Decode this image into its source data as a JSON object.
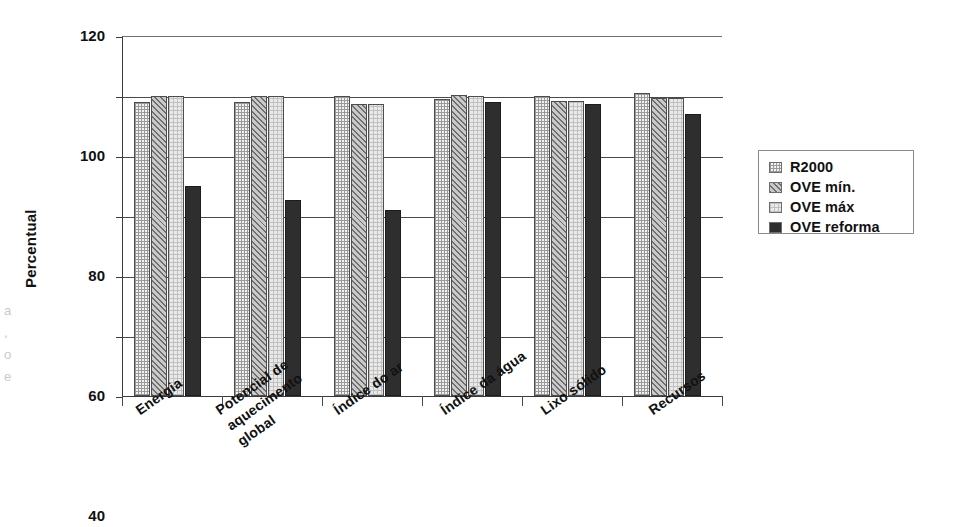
{
  "chart_data": {
    "type": "bar",
    "title": "",
    "xlabel": "",
    "ylabel": "Percentual",
    "ylim": [
      0,
      120
    ],
    "yticks": [
      0,
      20,
      40,
      60,
      80,
      100,
      120
    ],
    "grid": true,
    "legend_position": "right",
    "categories": [
      "Energia",
      "Potencial de\naquecimento\nglobal",
      "Índice do ar",
      "Índice da água",
      "Lixo sólido",
      "Recursos"
    ],
    "series": [
      {
        "name": "R2000",
        "pattern": "fine-grid",
        "values": [
          98,
          98,
          100,
          99,
          100,
          101
        ]
      },
      {
        "name": "OVE mín.",
        "pattern": "diagonal-hatch",
        "values": [
          100,
          100,
          97.5,
          100.5,
          98.5,
          99.5
        ]
      },
      {
        "name": "OVE máx",
        "pattern": "light-grid",
        "values": [
          100,
          100,
          97.5,
          100,
          98.5,
          99.5
        ]
      },
      {
        "name": "OVE reforma",
        "pattern": "solid-dark",
        "values": [
          70,
          65.5,
          62,
          98,
          97.5,
          94
        ]
      }
    ]
  },
  "legend": {
    "items": [
      {
        "label": "R2000"
      },
      {
        "label": "OVE mín."
      },
      {
        "label": "OVE máx"
      },
      {
        "label": "OVE reforma"
      }
    ]
  },
  "axes": {
    "y_title": "Percentual",
    "y_ticks": [
      "0",
      "20",
      "40",
      "60",
      "80",
      "100",
      "120"
    ]
  },
  "margin_artifacts": [
    "a",
    ",",
    "o",
    "e"
  ]
}
